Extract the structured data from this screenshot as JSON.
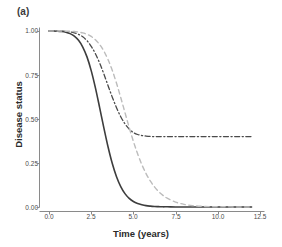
{
  "panel": {
    "label": "(a)"
  },
  "chart_data": {
    "type": "line",
    "title": "",
    "panel_label": "(a)",
    "xlabel": "Time (years)",
    "ylabel": "Disease status",
    "xlim": [
      0,
      12.5
    ],
    "ylim": [
      0,
      1.0
    ],
    "xticks": [
      0.0,
      2.5,
      5.0,
      7.5,
      10.0,
      12.5
    ],
    "xticklabels": [
      "0.0",
      "2.5",
      "5.0",
      "7.5",
      "10.0",
      "12.5"
    ],
    "yticks": [
      0.0,
      0.25,
      0.5,
      0.75,
      1.0
    ],
    "yticklabels": [
      "0.00",
      "0.25",
      "0.50",
      "0.75",
      "1.00"
    ],
    "grid": false,
    "legend": "none",
    "x": [
      0.0,
      0.25,
      0.5,
      0.75,
      1.0,
      1.25,
      1.5,
      1.75,
      2.0,
      2.25,
      2.5,
      2.75,
      3.0,
      3.25,
      3.5,
      3.75,
      4.0,
      4.25,
      4.5,
      4.75,
      5.0,
      5.25,
      5.5,
      5.75,
      6.0,
      6.25,
      6.5,
      6.75,
      7.0,
      7.5,
      8.0,
      8.5,
      9.0,
      9.5,
      10.0,
      10.5,
      11.0,
      11.5,
      12.0
    ],
    "series": [
      {
        "name": "solid-dark-curve",
        "style": "solid",
        "color": "#3d3d3d",
        "width": 1.6,
        "plateau": 0.0,
        "values": [
          1.0,
          1.0,
          0.999,
          0.997,
          0.993,
          0.985,
          0.971,
          0.947,
          0.909,
          0.853,
          0.775,
          0.677,
          0.565,
          0.45,
          0.341,
          0.247,
          0.172,
          0.116,
          0.076,
          0.049,
          0.031,
          0.02,
          0.013,
          0.008,
          0.005,
          0.003,
          0.002,
          0.001,
          0.001,
          0.0,
          0.0,
          0.0,
          0.0,
          0.0,
          0.0,
          0.0,
          0.0,
          0.0,
          0.0
        ]
      },
      {
        "name": "dashdot-dark-curve",
        "style": "dashdot",
        "color": "#4a4a4a",
        "width": 1.3,
        "plateau": 0.4,
        "values": [
          1.0,
          1.0,
          1.0,
          0.999,
          0.998,
          0.995,
          0.99,
          0.981,
          0.967,
          0.945,
          0.913,
          0.871,
          0.818,
          0.756,
          0.689,
          0.624,
          0.564,
          0.513,
          0.473,
          0.443,
          0.423,
          0.412,
          0.406,
          0.403,
          0.401,
          0.4,
          0.4,
          0.4,
          0.4,
          0.4,
          0.4,
          0.4,
          0.4,
          0.4,
          0.4,
          0.4,
          0.4,
          0.4,
          0.4
        ]
      },
      {
        "name": "dashed-gray-curve",
        "style": "dashed",
        "color": "#bcbcbc",
        "width": 1.4,
        "plateau": 0.0,
        "values": [
          1.0,
          1.0,
          1.0,
          1.0,
          0.999,
          0.998,
          0.997,
          0.994,
          0.989,
          0.981,
          0.969,
          0.95,
          0.923,
          0.886,
          0.837,
          0.776,
          0.703,
          0.622,
          0.537,
          0.452,
          0.373,
          0.302,
          0.241,
          0.19,
          0.148,
          0.114,
          0.087,
          0.066,
          0.05,
          0.028,
          0.015,
          0.008,
          0.004,
          0.002,
          0.001,
          0.001,
          0.0,
          0.0,
          0.0
        ]
      }
    ]
  },
  "axes": {
    "x_title": "Time (years)",
    "y_title": "Disease status"
  }
}
